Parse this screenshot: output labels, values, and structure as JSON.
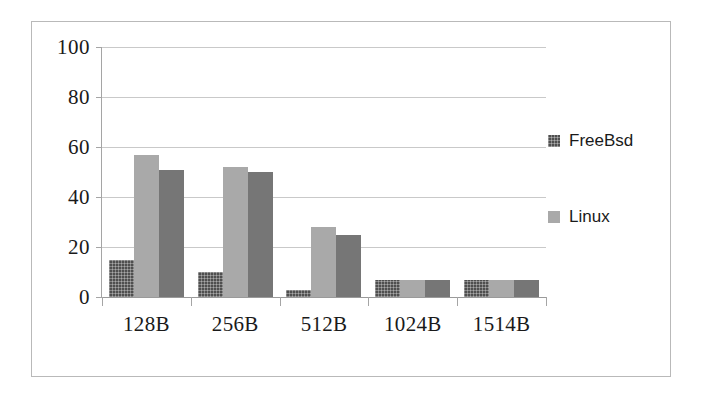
{
  "chart_data": {
    "type": "bar",
    "title": "",
    "subtitle": "",
    "xlabel": "",
    "ylabel": "",
    "categories": [
      "128B",
      "256B",
      "512B",
      "1024B",
      "1514B"
    ],
    "series": [
      {
        "name": "FreeBsd",
        "color": "#4f4f4f",
        "values": [
          15,
          10,
          3,
          7,
          7
        ]
      },
      {
        "name": "Linux",
        "color": "#a9a9a9",
        "values": [
          57,
          52,
          28,
          7,
          7
        ]
      },
      {
        "name": "",
        "color": "#767676",
        "values": [
          51,
          50,
          25,
          7,
          7
        ]
      }
    ],
    "ylim": [
      0,
      100
    ],
    "yticks": [
      0,
      20,
      40,
      60,
      80,
      100
    ],
    "ytick_labels": [
      "0",
      "20",
      "40",
      "60",
      "80",
      "100"
    ],
    "grid": true,
    "grid_axis": "y",
    "legend_position": "right",
    "legend_entries": [
      "FreeBsd",
      "Linux"
    ]
  },
  "colors": {
    "frame_border": "#b9b9b9",
    "gridline": "#c9c9c9",
    "axis_line": "#a5a5a5",
    "text": "#1a1a1a",
    "background": "#ffffff"
  }
}
